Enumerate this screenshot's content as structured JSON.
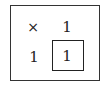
{
  "grid": {
    "rows": [
      [
        "×",
        "1"
      ],
      [
        "1",
        "1"
      ]
    ],
    "highlighted_cell": {
      "row": 1,
      "col": 1
    }
  }
}
